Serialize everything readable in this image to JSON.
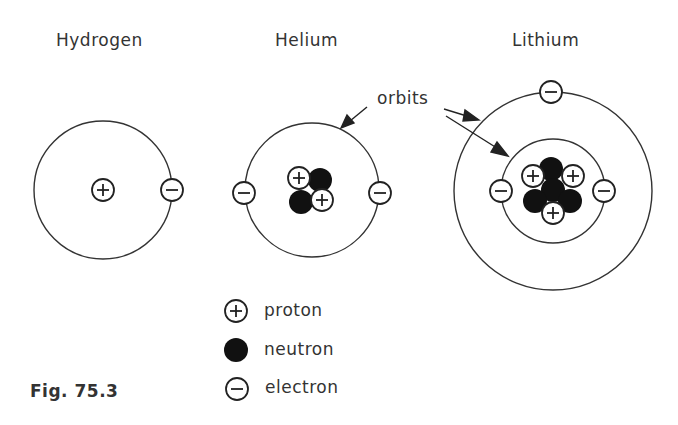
{
  "figure": {
    "caption": "Fig. 75.3",
    "atoms": [
      {
        "name": "Hydrogen",
        "protons": 1,
        "neutrons": 0,
        "electrons": 1,
        "orbits": 1
      },
      {
        "name": "Helium",
        "protons": 2,
        "neutrons": 2,
        "electrons": 2,
        "orbits": 1
      },
      {
        "name": "Lithium",
        "protons": 3,
        "neutrons": 4,
        "electrons": 3,
        "orbits": 2
      }
    ],
    "annotation": "orbits",
    "legend": [
      {
        "symbol": "plus-circle",
        "label": "proton"
      },
      {
        "symbol": "filled-circle",
        "label": "neutron"
      },
      {
        "symbol": "minus-circle",
        "label": "electron"
      }
    ]
  }
}
